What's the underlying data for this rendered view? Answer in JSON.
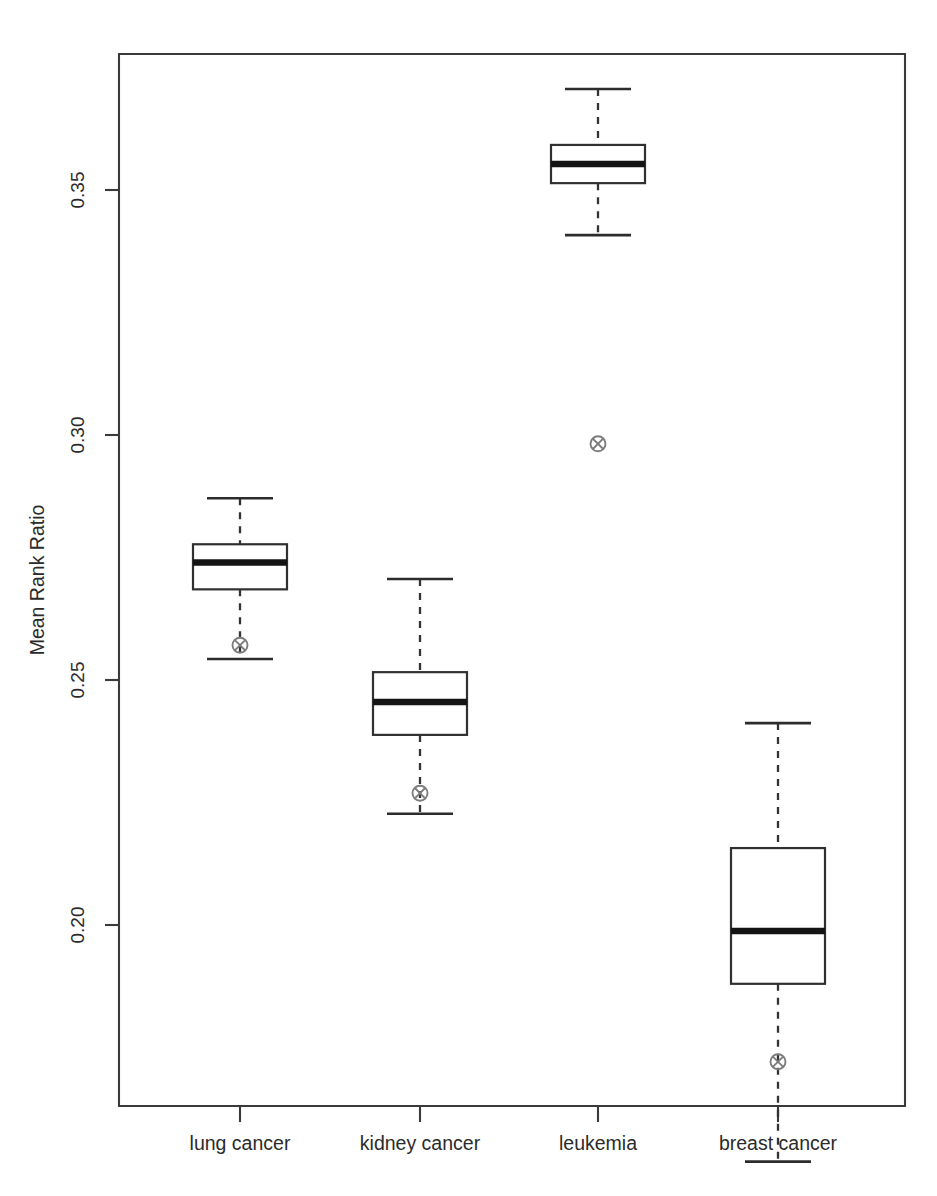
{
  "chart_data": {
    "type": "box",
    "title": "",
    "xlabel": "",
    "ylabel": "Mean Rank Ratio",
    "categories": [
      "lung cancer",
      "kidney cancer",
      "leukemia",
      "breast cancer"
    ],
    "ylim": [
      0.1465,
      0.379
    ],
    "yticks": [
      0.2,
      0.25,
      0.3,
      0.35
    ],
    "ytick_labels": [
      "0.20",
      "0.25",
      "0.30",
      "0.35"
    ],
    "grid": false,
    "legend": "none",
    "boxes": [
      {
        "category": "lung cancer",
        "whisker_high": 0.2871,
        "q3": 0.2777,
        "median": 0.274,
        "q1": 0.2685,
        "whisker_low": 0.2543,
        "marker": 0.2571,
        "marker_label": "point-marker"
      },
      {
        "category": "kidney cancer",
        "whisker_high": 0.2706,
        "q3": 0.2516,
        "median": 0.2455,
        "q1": 0.2388,
        "whisker_low": 0.2227,
        "marker": 0.2269,
        "marker_label": "point-marker"
      },
      {
        "category": "leukemia",
        "whisker_high": 0.3706,
        "q3": 0.3592,
        "median": 0.3553,
        "q1": 0.3514,
        "whisker_low": 0.3408,
        "marker": 0.2982,
        "marker_label": "point-marker"
      },
      {
        "category": "breast cancer",
        "whisker_high": 0.2412,
        "q3": 0.2157,
        "median": 0.1988,
        "q1": 0.188,
        "whisker_low": 0.1517,
        "marker": 0.1721,
        "marker_label": "point-marker"
      }
    ]
  },
  "colors": {
    "box_stroke": "#303030",
    "median": "#141414",
    "whisker": "#333333",
    "marker": "#7d7d7d",
    "frame": "#3a3a3a",
    "background": "#ffffff",
    "text": "#2b2b2b"
  },
  "caption": ""
}
